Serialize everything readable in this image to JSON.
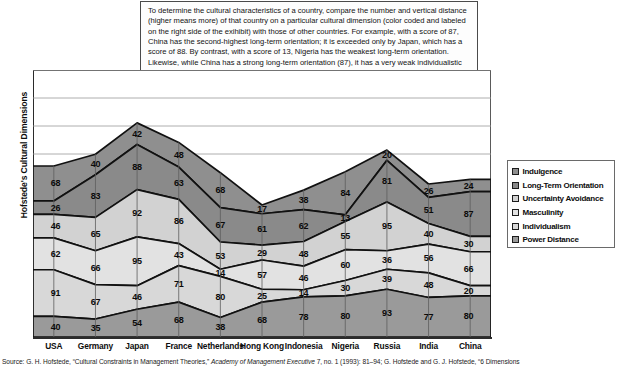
{
  "callout": {
    "text": "To determine the cultural characteristics of a country, compare the number and vertical distance (higher means more) of that country on a particular cultural dimension (color coded and labeled on the right side of the exihibit) with those of other countries. For example, with a score of 87, China has the second-highest long-term orientation; it is exceeded only by Japan, which has a score of 88. By contrast, with a score of 13, Nigeria has the weakest long-term orientation. Likewise, while China has a strong long-term orientation (87), it has a very weak individualistic orientation (20)."
  },
  "axis": {
    "y_title": "Hofstede's Cultural Dimensions"
  },
  "source": {
    "prefix": "Source: G. H. Hofstede, “Cultural Constraints in Management Theories,” ",
    "italic": "Academy of Management Executive",
    "suffix": " 7, no. 1 (1993): 81–94; G. Hofstede and G. J. Hofstede, “6 Dimensions"
  },
  "legend": {
    "position": "right",
    "items": [
      {
        "label": "Indulgence",
        "color": "#8f8f8f"
      },
      {
        "label": "Long-Term Orientation",
        "color": "#8a8a8a"
      },
      {
        "label": "Uncertainty Avoidance",
        "color": "#d2d2d2"
      },
      {
        "label": "Masculinity",
        "color": "#e2e2e2"
      },
      {
        "label": "Individualism",
        "color": "#d8d8d8"
      },
      {
        "label": "Power Distance",
        "color": "#9a9a9a"
      }
    ]
  },
  "chart_data": {
    "type": "area",
    "title": "",
    "xlabel": "",
    "ylabel": "Hofstede's Cultural Dimensions",
    "grid": true,
    "stacked": true,
    "ylim": [
      0,
      520
    ],
    "categories": [
      "USA",
      "Germany",
      "Japan",
      "France",
      "Netherlands",
      "Hong Kong",
      "Indonesia",
      "Nigeria",
      "Russia",
      "India",
      "China"
    ],
    "series": [
      {
        "name": "Power Distance",
        "color": "#9a9a9a",
        "values": [
          40,
          35,
          54,
          68,
          38,
          68,
          78,
          80,
          93,
          77,
          80
        ]
      },
      {
        "name": "Individualism",
        "color": "#d8d8d8",
        "values": [
          91,
          67,
          46,
          71,
          80,
          25,
          14,
          30,
          39,
          48,
          20
        ]
      },
      {
        "name": "Masculinity",
        "color": "#e2e2e2",
        "values": [
          62,
          66,
          95,
          43,
          14,
          57,
          46,
          60,
          36,
          56,
          66
        ]
      },
      {
        "name": "Uncertainty Avoidance",
        "color": "#d2d2d2",
        "values": [
          46,
          65,
          92,
          86,
          53,
          29,
          48,
          55,
          95,
          40,
          30
        ]
      },
      {
        "name": "Long-Term Orientation",
        "color": "#8a8a8a",
        "values": [
          26,
          83,
          88,
          63,
          67,
          61,
          62,
          13,
          81,
          51,
          87
        ]
      },
      {
        "name": "Indulgence",
        "color": "#8f8f8f",
        "values": [
          68,
          40,
          42,
          48,
          68,
          17,
          38,
          84,
          20,
          26,
          24
        ]
      }
    ]
  }
}
